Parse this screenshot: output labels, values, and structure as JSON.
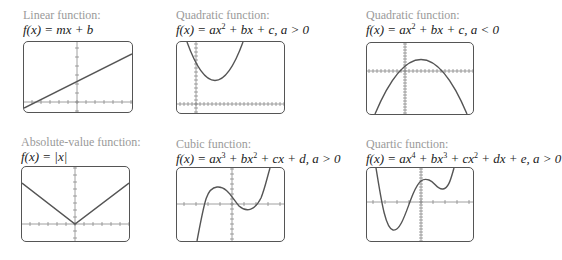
{
  "figure": {
    "panels": [
      {
        "id": "linear",
        "label": "Linear function:",
        "formula_parts": [
          "f",
          "(",
          "x",
          ") = ",
          "mx",
          " + ",
          "b"
        ],
        "formula_text": "f(x) = mx + b",
        "box": {
          "x": 23,
          "y": 41,
          "w": 110,
          "h": 72
        },
        "axes": {
          "vx": 54,
          "hy": 61
        },
        "curve_type": "linear"
      },
      {
        "id": "quadratic-pos",
        "label": "Quadratic function:",
        "formula_text": "f(x) = ax² + bx + c, a > 0",
        "box": {
          "x": 176,
          "y": 41,
          "w": 109,
          "h": 73
        },
        "axes": {
          "vx": 19,
          "hy": 63
        },
        "curve_type": "quadratic-up"
      },
      {
        "id": "quadratic-neg",
        "label": "Quadratic function:",
        "formula_text": "f(x) = ax² + bx + c, a < 0",
        "box": {
          "x": 366,
          "y": 42,
          "w": 108,
          "h": 73
        },
        "axes": {
          "vx": 38,
          "hy": 28
        },
        "curve_type": "quadratic-down"
      },
      {
        "id": "absolute",
        "label": "Absolute-value function:",
        "formula_text": "f(x) = |x|",
        "box": {
          "x": 21,
          "y": 166,
          "w": 109,
          "h": 76
        },
        "axes": {
          "vx": 54,
          "hy": 58
        },
        "curve_type": "abs"
      },
      {
        "id": "cubic",
        "label": "Cubic function:",
        "formula_text": "f(x) = ax³ + bx² + cx + d, a > 0",
        "box": {
          "x": 176,
          "y": 167,
          "w": 109,
          "h": 75
        },
        "axes": {
          "vx": 55,
          "hy": 37
        },
        "curve_type": "cubic"
      },
      {
        "id": "quartic",
        "label": "Quartic function:",
        "formula_text": "f(x) = ax⁴ + bx³ + cx² + dx + e, a > 0",
        "box": {
          "x": 366,
          "y": 167,
          "w": 108,
          "h": 75
        },
        "axes": {
          "vx": 54,
          "hy": 34
        },
        "curve_type": "quartic"
      }
    ],
    "colors": {
      "label": "#9a9a9a",
      "formula": "#1a1a1a",
      "frame": "#555555",
      "axis": "#777777",
      "curve": "#555555"
    }
  },
  "labels": {
    "p0": "Linear function:",
    "p1": "Quadratic function:",
    "p2": "Quadratic function:",
    "p3": "Absolute-value function:",
    "p4": "Cubic function:",
    "p5": "Quartic function:"
  },
  "formulas": {
    "p0": {
      "lhs": "f(x) = ",
      "rhs": "mx + b"
    },
    "p1": {
      "lhs": "f(x) = ",
      "a": "ax",
      "e1": "2",
      "rest": " + bx + c, ",
      "cond": "a > 0"
    },
    "p2": {
      "lhs": "f(x) = ",
      "a": "ax",
      "e1": "2",
      "rest": " + bx + c, ",
      "cond": "a < 0"
    },
    "p3": {
      "lhs": "f(x) = ",
      "rhs": "|x|"
    },
    "p4": {
      "lhs": "f(x) = ",
      "a": "ax",
      "e1": "3",
      "b": " + bx",
      "e2": "2",
      "rest": " + cx + d, ",
      "cond": "a > 0"
    },
    "p5": {
      "lhs": "f(x) = ",
      "a": "ax",
      "e1": "4",
      "b": " + bx",
      "e2": "3",
      "c": " + cx",
      "e3": "2",
      "rest": " + dx + e, ",
      "cond": "a > 0"
    }
  }
}
